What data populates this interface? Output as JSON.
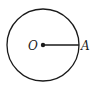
{
  "diagram": {
    "type": "geometry-circle",
    "center": {
      "label": "O",
      "x": 43,
      "y": 45
    },
    "radius": 36,
    "point_on_circle": {
      "label": "A",
      "x": 79,
      "y": 45
    },
    "segments": [
      {
        "from": "O",
        "to": "A"
      }
    ],
    "colors": {
      "stroke": "#1a1a1a",
      "background": "#ffffff"
    }
  }
}
